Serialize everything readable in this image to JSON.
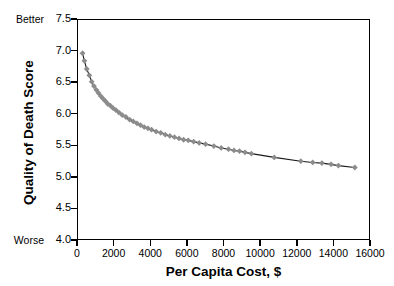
{
  "chart_data": {
    "type": "line",
    "title": "",
    "xlabel": "Per Capita Cost, $",
    "ylabel": "Quality of Death Score",
    "xlim": [
      0,
      16000
    ],
    "ylim": [
      4.0,
      7.5
    ],
    "xticks": [
      0,
      2000,
      4000,
      6000,
      8000,
      10000,
      12000,
      14000,
      16000
    ],
    "xtick_labels": [
      "0",
      "2000",
      "4000",
      "6000",
      "8000",
      "10000",
      "12000",
      "14000",
      "16000"
    ],
    "yticks": [
      4.0,
      4.5,
      5.0,
      5.5,
      6.0,
      6.5,
      7.0,
      7.5
    ],
    "ytick_labels": [
      "4.0",
      "4.5",
      "5.0",
      "5.5",
      "6.0",
      "6.5",
      "7.0",
      "7.5"
    ],
    "axis_end_labels": {
      "top": "Better",
      "bottom": "Worse"
    },
    "grid": false,
    "legend": null,
    "marker": "diamond",
    "marker_color": "#8c8c8c",
    "line_color": "#1a1a1a",
    "series": [
      {
        "name": "Quality of Death Score vs Per Capita Cost",
        "points": [
          [
            330,
            6.95
          ],
          [
            430,
            6.83
          ],
          [
            560,
            6.7
          ],
          [
            700,
            6.6
          ],
          [
            830,
            6.5
          ],
          [
            950,
            6.43
          ],
          [
            1080,
            6.37
          ],
          [
            1200,
            6.32
          ],
          [
            1330,
            6.27
          ],
          [
            1450,
            6.23
          ],
          [
            1580,
            6.19
          ],
          [
            1700,
            6.15
          ],
          [
            1850,
            6.12
          ],
          [
            2000,
            6.08
          ],
          [
            2150,
            6.05
          ],
          [
            2320,
            6.01
          ],
          [
            2500,
            5.97
          ],
          [
            2700,
            5.94
          ],
          [
            2900,
            5.9
          ],
          [
            3100,
            5.87
          ],
          [
            3300,
            5.84
          ],
          [
            3500,
            5.81
          ],
          [
            3700,
            5.78
          ],
          [
            3900,
            5.76
          ],
          [
            4100,
            5.74
          ],
          [
            4350,
            5.71
          ],
          [
            4600,
            5.69
          ],
          [
            4850,
            5.66
          ],
          [
            5100,
            5.64
          ],
          [
            5350,
            5.62
          ],
          [
            5600,
            5.6
          ],
          [
            5850,
            5.58
          ],
          [
            6100,
            5.57
          ],
          [
            6400,
            5.55
          ],
          [
            6700,
            5.53
          ],
          [
            7050,
            5.51
          ],
          [
            7500,
            5.48
          ],
          [
            7900,
            5.45
          ],
          [
            8300,
            5.43
          ],
          [
            8600,
            5.41
          ],
          [
            8900,
            5.4
          ],
          [
            9200,
            5.38
          ],
          [
            9550,
            5.36
          ],
          [
            10800,
            5.3
          ],
          [
            12250,
            5.24
          ],
          [
            12900,
            5.22
          ],
          [
            13400,
            5.21
          ],
          [
            13900,
            5.19
          ],
          [
            14300,
            5.17
          ],
          [
            15200,
            5.14
          ]
        ]
      }
    ]
  }
}
